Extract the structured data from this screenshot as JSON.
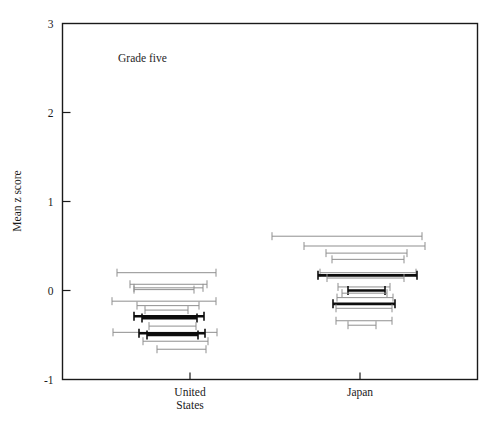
{
  "figure": {
    "annotation": "Grade five",
    "annotation_x": 0.52,
    "annotation_y": 2.53
  },
  "axes": {
    "ylabel": "Mean z score",
    "xlabel": "",
    "ytick_labels": [
      "3",
      "2",
      "1",
      "0",
      "-1"
    ],
    "ytick_values": [
      3,
      2,
      1,
      0,
      -1
    ],
    "xtick_labels": [
      "United States",
      "Japan"
    ],
    "xtick_label_lines": [
      [
        "United",
        "States"
      ],
      [
        "Japan"
      ]
    ],
    "ylim": [
      -1,
      3
    ],
    "frame": "box",
    "grid": false
  },
  "colors": {
    "axis": "#1a1a1a",
    "interval_light": "#8f8f8f",
    "interval_dark": "#0d0d0d",
    "background": "#ffffff"
  },
  "chart_data": {
    "type": "scatter",
    "subtype": "horizontal-confidence-interval-strips",
    "title": "",
    "subtitle": "Grade five",
    "xlabel": "",
    "ylabel": "Mean z score",
    "ylim": [
      -1,
      3
    ],
    "categories": [
      "United States",
      "Japan"
    ],
    "tick_positions_px": [
      190,
      360
    ],
    "note": "Each row is a horizontal interval (range bar with end caps) plotted at a given mean z score value. 'weight' light = thin grey line, dark = thick black line.",
    "series": [
      {
        "name": "United States",
        "intervals": [
          {
            "y": 0.2,
            "x_left": 117,
            "x_right": 216,
            "weight": "light"
          },
          {
            "y": 0.07,
            "x_left": 130,
            "x_right": 207,
            "weight": "light"
          },
          {
            "y": 0.03,
            "x_left": 134,
            "x_right": 203,
            "weight": "light"
          },
          {
            "y": 0.01,
            "x_left": 134,
            "x_right": 194,
            "weight": "light"
          },
          {
            "y": -0.12,
            "x_left": 112,
            "x_right": 216,
            "weight": "light"
          },
          {
            "y": -0.17,
            "x_left": 137,
            "x_right": 199,
            "weight": "light"
          },
          {
            "y": -0.22,
            "x_left": 145,
            "x_right": 188,
            "weight": "light"
          },
          {
            "y": -0.29,
            "x_left": 134,
            "x_right": 204,
            "weight": "dark"
          },
          {
            "y": -0.31,
            "x_left": 142,
            "x_right": 197,
            "weight": "dark"
          },
          {
            "y": -0.4,
            "x_left": 149,
            "x_right": 196,
            "weight": "light"
          },
          {
            "y": -0.47,
            "x_left": 113,
            "x_right": 217,
            "weight": "light"
          },
          {
            "y": -0.48,
            "x_left": 139,
            "x_right": 205,
            "weight": "dark"
          },
          {
            "y": -0.5,
            "x_left": 147,
            "x_right": 198,
            "weight": "dark"
          },
          {
            "y": -0.57,
            "x_left": 143,
            "x_right": 208,
            "weight": "light"
          },
          {
            "y": -0.66,
            "x_left": 157,
            "x_right": 206,
            "weight": "light"
          }
        ]
      },
      {
        "name": "Japan",
        "intervals": [
          {
            "y": 0.61,
            "x_left": 272,
            "x_right": 422,
            "weight": "light"
          },
          {
            "y": 0.5,
            "x_left": 304,
            "x_right": 425,
            "weight": "light"
          },
          {
            "y": 0.42,
            "x_left": 326,
            "x_right": 407,
            "weight": "light"
          },
          {
            "y": 0.35,
            "x_left": 332,
            "x_right": 404,
            "weight": "light"
          },
          {
            "y": 0.2,
            "x_left": 320,
            "x_right": 416,
            "weight": "light"
          },
          {
            "y": 0.17,
            "x_left": 318,
            "x_right": 417,
            "weight": "dark"
          },
          {
            "y": 0.14,
            "x_left": 327,
            "x_right": 404,
            "weight": "light"
          },
          {
            "y": 0.04,
            "x_left": 338,
            "x_right": 390,
            "weight": "light"
          },
          {
            "y": 0.0,
            "x_left": 348,
            "x_right": 385,
            "weight": "dark"
          },
          {
            "y": -0.03,
            "x_left": 342,
            "x_right": 387,
            "weight": "light"
          },
          {
            "y": -0.08,
            "x_left": 337,
            "x_right": 393,
            "weight": "light"
          },
          {
            "y": -0.15,
            "x_left": 333,
            "x_right": 395,
            "weight": "dark"
          },
          {
            "y": -0.2,
            "x_left": 336,
            "x_right": 392,
            "weight": "light"
          },
          {
            "y": -0.34,
            "x_left": 336,
            "x_right": 392,
            "weight": "light"
          },
          {
            "y": -0.39,
            "x_left": 348,
            "x_right": 376,
            "weight": "light"
          }
        ]
      }
    ]
  }
}
